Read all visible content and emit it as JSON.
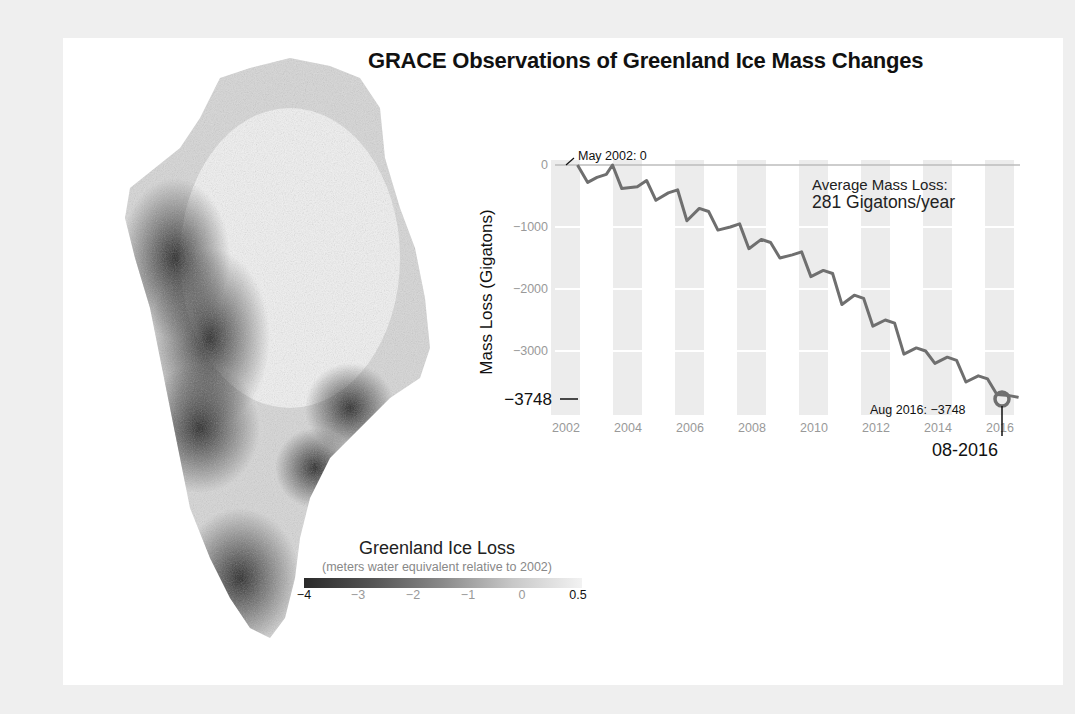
{
  "title": "GRACE Observations of Greenland Ice Mass Changes",
  "map": {
    "subject": "Greenland ice mass change map (grayscale)",
    "legend": {
      "title": "Greenland Ice Loss",
      "subtitle": "(meters water equivalent relative to 2002)",
      "ticks": [
        "−4",
        "−3",
        "−2",
        "−1",
        "0",
        "0.5"
      ]
    }
  },
  "chart": {
    "ylabel": "Mass Loss (Gigatons)",
    "avg_label_line1": "Average Mass Loss:",
    "avg_label_line2": "281 Gigatons/year",
    "start_annotation": "May 2002: 0",
    "end_annotation": "Aug 2016: −3748",
    "current_value_label": "−3748",
    "date_label": "08-2016"
  },
  "chart_data": {
    "type": "line",
    "title": "GRACE Observations of Greenland Ice Mass Changes",
    "xlabel": "",
    "ylabel": "Mass Loss (Gigatons)",
    "x_ticks": [
      "2002",
      "2004",
      "2006",
      "2008",
      "2010",
      "2012",
      "2014",
      "2016"
    ],
    "y_ticks": [
      0,
      -1000,
      -2000,
      -3000
    ],
    "xlim": [
      2002,
      2016.7
    ],
    "ylim": [
      -3900,
      100
    ],
    "grid": "horizontal gridlines + alternating yearly shaded bands",
    "annotations": [
      {
        "x": 2002.37,
        "y": 0,
        "text": "May 2002: 0",
        "source": "read from chart label"
      },
      {
        "x": 2016.6,
        "y": -3748,
        "text": "Aug 2016: −3748",
        "source": "read from chart label"
      },
      {
        "text": "Average Mass Loss: 281 Gigatons/year",
        "source": "read from chart label"
      }
    ],
    "series": [
      {
        "name": "Greenland mass change",
        "values_note": "Only the first point (0) and last point (-3748) are printed on the chart. All other points are approximate values estimated from the line's pixel position against the gridlines, not read from data labels.",
        "x": [
          2002.37,
          2002.7,
          2003.0,
          2003.3,
          2003.5,
          2003.8,
          2004.3,
          2004.6,
          2004.9,
          2005.3,
          2005.6,
          2005.9,
          2006.3,
          2006.6,
          2006.9,
          2007.3,
          2007.6,
          2007.9,
          2008.3,
          2008.6,
          2008.9,
          2009.3,
          2009.6,
          2009.9,
          2010.3,
          2010.6,
          2010.9,
          2011.3,
          2011.6,
          2011.9,
          2012.3,
          2012.6,
          2012.9,
          2013.3,
          2013.6,
          2013.9,
          2014.3,
          2014.6,
          2014.9,
          2015.3,
          2015.6,
          2015.9,
          2016.3,
          2016.6
        ],
        "values": [
          0,
          -280,
          -200,
          -150,
          0,
          -380,
          -350,
          -250,
          -570,
          -450,
          -400,
          -900,
          -700,
          -750,
          -1050,
          -1000,
          -950,
          -1350,
          -1200,
          -1250,
          -1500,
          -1450,
          -1400,
          -1800,
          -1700,
          -1750,
          -2250,
          -2100,
          -2150,
          -2600,
          -2500,
          -2550,
          -3050,
          -2950,
          -3000,
          -3200,
          -3100,
          -3150,
          -3500,
          -3400,
          -3450,
          -3700,
          -3720,
          -3748
        ]
      }
    ]
  }
}
